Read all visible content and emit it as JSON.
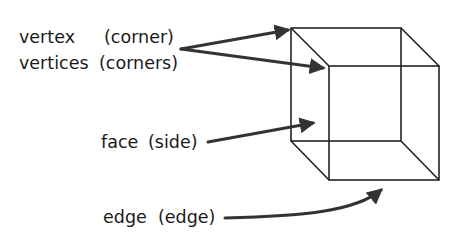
{
  "diagram": {
    "type": "labeled-cube",
    "labels": [
      {
        "term": "vertex",
        "translation": "(corner)"
      },
      {
        "term": "vertices",
        "translation": "(corners)"
      },
      {
        "term": "face",
        "translation": "(side)"
      },
      {
        "term": "edge",
        "translation": "(edge)"
      }
    ],
    "arrows": [
      {
        "from": "vertex",
        "points_to": "back top-left vertex"
      },
      {
        "from": "vertices",
        "points_to": "front top-left vertex"
      },
      {
        "from": "face",
        "points_to": "left face"
      },
      {
        "from": "edge",
        "points_to": "front bottom edge"
      }
    ],
    "colors": {
      "line": "#222222",
      "arrow": "#333333",
      "text": "#1a1a1a",
      "background": "#ffffff"
    }
  }
}
